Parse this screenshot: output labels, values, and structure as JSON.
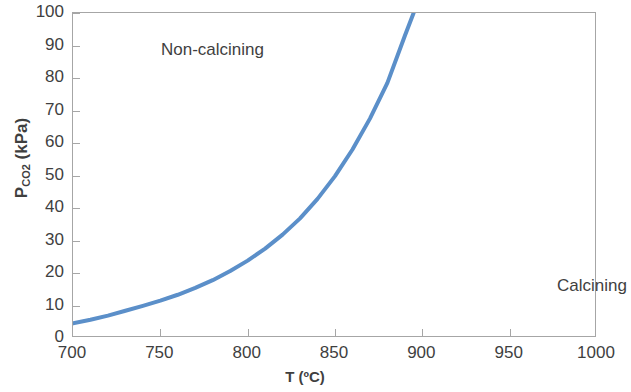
{
  "chart_data": {
    "type": "line",
    "title": "",
    "xlabel": "T (ºC)",
    "ylabel": "P_CO2 (kPa)",
    "ylabel_base": "P",
    "ylabel_sub": "CO2",
    "ylabel_unit": " (kPa)",
    "xlim": [
      700,
      1000
    ],
    "ylim": [
      0,
      100
    ],
    "grid": false,
    "legend": null,
    "xticks": [
      700,
      750,
      800,
      850,
      900,
      950,
      1000
    ],
    "yticks": [
      0,
      10,
      20,
      30,
      40,
      50,
      60,
      70,
      80,
      90,
      100
    ],
    "series": [
      {
        "name": "CO2 equilibrium decomposition pressure",
        "color": "#5b8fc9",
        "linewidth": 4,
        "x": [
          700,
          710,
          720,
          730,
          740,
          750,
          760,
          770,
          780,
          790,
          800,
          810,
          820,
          830,
          840,
          850,
          860,
          870,
          880,
          890,
          895
        ],
        "y": [
          4.5,
          5.6,
          6.9,
          8.4,
          9.9,
          11.5,
          13.3,
          15.4,
          17.8,
          20.6,
          23.8,
          27.5,
          31.8,
          36.8,
          42.8,
          49.8,
          58.0,
          67.5,
          78.5,
          93.0,
          100.0
        ]
      }
    ],
    "annotations": [
      {
        "text": "Non-calcining",
        "x": 730,
        "y": 92
      },
      {
        "text": "Calcining",
        "x": 936,
        "y": 23
      }
    ]
  },
  "axes": {
    "x_tick_labels": [
      "700",
      "750",
      "800",
      "850",
      "900",
      "950",
      "1000"
    ],
    "y_tick_labels": [
      "0",
      "10",
      "20",
      "30",
      "40",
      "50",
      "60",
      "70",
      "80",
      "90",
      "100"
    ],
    "x_title": "T (ºC)",
    "y_title_base": "P",
    "y_title_sub": "CO2",
    "y_title_rest": " (kPa)"
  },
  "annotations": {
    "non_calcining": "Non-calcining",
    "calcining": "Calcining"
  },
  "colors": {
    "curve": "#5b8fc9",
    "axis": "#a6a6a6",
    "text": "#3f3f3f",
    "background": "#ffffff"
  }
}
